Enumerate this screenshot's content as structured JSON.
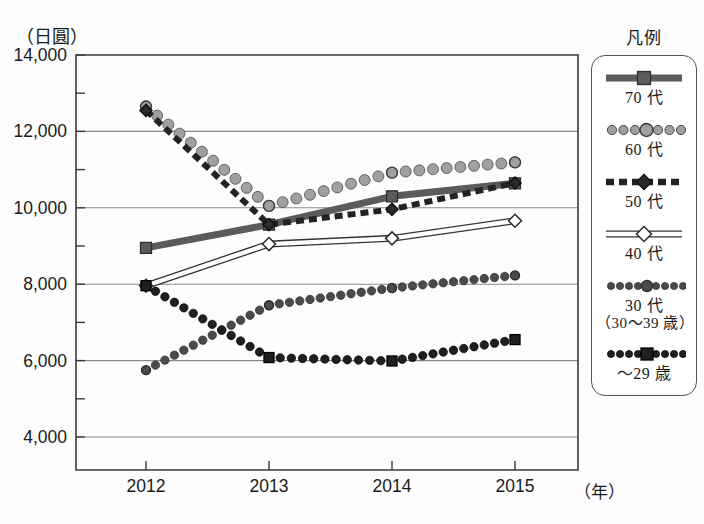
{
  "axis": {
    "y_unit_label": "（日圓）",
    "x_unit_label": "（年）",
    "y_ticks": [
      "14,000",
      "12,000",
      "10,000",
      "8,000",
      "6,000",
      "4,000"
    ],
    "x_ticks": [
      "2012",
      "2013",
      "2014",
      "2015"
    ]
  },
  "legend": {
    "title": "凡例",
    "items": [
      {
        "label": "70 代",
        "sub": "",
        "marker": "square",
        "style": "solid-thick",
        "color": "#5b5b5b"
      },
      {
        "label": "60 代",
        "sub": "",
        "marker": "circle",
        "style": "dotted-round",
        "color": "#9a9a9a"
      },
      {
        "label": "50 代",
        "sub": "",
        "marker": "diamond",
        "style": "dashed",
        "color": "#2b2b2b"
      },
      {
        "label": "40 代",
        "sub": "",
        "marker": "diamond-open",
        "style": "solid-thin",
        "color": "#ffffff"
      },
      {
        "label": "30 代",
        "sub": "（30〜39 歳）",
        "marker": "circle-small",
        "style": "dotted-fine",
        "color": "#4a4a4a"
      },
      {
        "label": "〜29 歳",
        "sub": "",
        "marker": "square-small",
        "style": "dotted-fine",
        "color": "#1f1f1f"
      }
    ]
  },
  "chart_data": {
    "type": "line",
    "title": "",
    "xlabel": "（年）",
    "ylabel": "（日圓）",
    "x": [
      "2012",
      "2013",
      "2014",
      "2015"
    ],
    "ylim": [
      4000,
      14000
    ],
    "ytick_interval": 2000,
    "yminor_interval": 1000,
    "grid": true,
    "legend_position": "right",
    "series": [
      {
        "name": "70 代",
        "values": [
          8950,
          9560,
          10300,
          10640
        ]
      },
      {
        "name": "60 代",
        "values": [
          12650,
          10050,
          10920,
          11190
        ]
      },
      {
        "name": "50 代",
        "values": [
          12550,
          9560,
          9960,
          10650
        ]
      },
      {
        "name": "40 代",
        "values": [
          7960,
          9050,
          9200,
          9660
        ]
      },
      {
        "name": "30 代（30〜39 歳）",
        "values": [
          5750,
          7450,
          7900,
          8230
        ]
      },
      {
        "name": "〜29 歳",
        "values": [
          7960,
          6080,
          5990,
          6550
        ]
      }
    ]
  }
}
